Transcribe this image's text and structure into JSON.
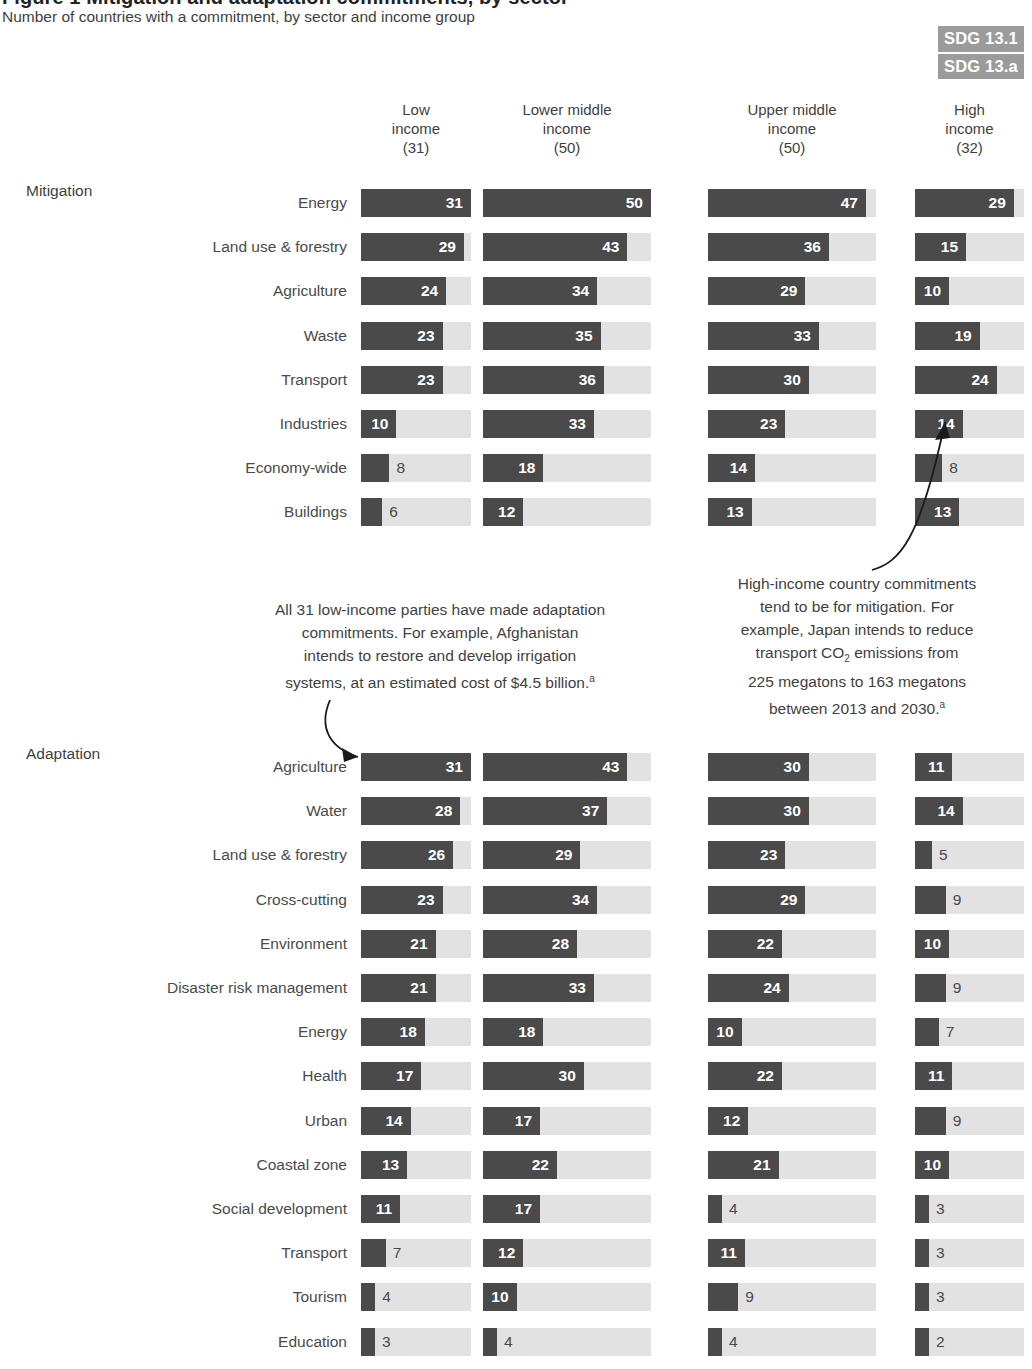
{
  "header": {
    "title": "Figure 1  Mitigation and adaptation commitments, by sector",
    "subtitle": "Number of countries with a commitment, by sector and income group",
    "badges": [
      "SDG 13.1",
      "SDG 13.a"
    ]
  },
  "sections": {
    "mitigation_label": "Mitigation",
    "adaptation_label": "Adaptation"
  },
  "annotations": {
    "left": {
      "line1": "All 31 low-income parties have made adaptation",
      "line2": "commitments. For example, Afghanistan",
      "line3": "intends to restore and develop irrigation",
      "line4": "systems, at an estimated cost of $4.5 billion.",
      "marker": "a"
    },
    "right": {
      "line1": "High-income country commitments",
      "line2": "tend to be for mitigation. For",
      "line3": "example, Japan intends to reduce",
      "line4a": "transport CO",
      "line4sub": "2",
      "line4b": " emissions from",
      "line5": "225 megatons to 163 megatons",
      "line6": "between 2013 and 2030.",
      "marker": "a"
    }
  },
  "colors": {
    "bar": "#4a4a4a",
    "track": "#e2e2e2",
    "badge": "#9b9b9b",
    "text": "#3f3f3f"
  },
  "chart_data": {
    "type": "bar",
    "title": "Mitigation and adaptation commitments, by sector",
    "subtitle": "Number of countries with a commitment, by sector and income group",
    "xlabel": "",
    "ylabel": "",
    "grid": false,
    "legend_position": "none",
    "orientation": "horizontal",
    "groups": [
      {
        "name": "Low income",
        "header_lines": [
          "Low",
          "income",
          "(31)"
        ],
        "total": 31,
        "axis_max": 31
      },
      {
        "name": "Lower middle income",
        "header_lines": [
          "Lower middle",
          "income",
          "(50)"
        ],
        "total": 50,
        "axis_max": 50
      },
      {
        "name": "Upper middle income",
        "header_lines": [
          "Upper middle",
          "income",
          "(50)"
        ],
        "total": 50,
        "axis_max": 50
      },
      {
        "name": "High income",
        "header_lines": [
          "High",
          "income",
          "(32)"
        ],
        "total": 32,
        "axis_max": 32
      }
    ],
    "panels": [
      {
        "name": "Mitigation",
        "categories": [
          "Energy",
          "Land use & forestry",
          "Agriculture",
          "Waste",
          "Transport",
          "Industries",
          "Economy-wide",
          "Buildings"
        ],
        "series": [
          {
            "name": "Low income",
            "values": [
              31,
              29,
              24,
              23,
              23,
              10,
              8,
              6
            ]
          },
          {
            "name": "Lower middle income",
            "values": [
              50,
              43,
              34,
              35,
              36,
              33,
              18,
              12
            ]
          },
          {
            "name": "Upper middle income",
            "values": [
              47,
              36,
              29,
              33,
              30,
              23,
              14,
              13
            ]
          },
          {
            "name": "High income",
            "values": [
              29,
              15,
              10,
              19,
              24,
              14,
              8,
              13
            ]
          }
        ]
      },
      {
        "name": "Adaptation",
        "categories": [
          "Agriculture",
          "Water",
          "Land use & forestry",
          "Cross-cutting",
          "Environment",
          "Disaster risk management",
          "Energy",
          "Health",
          "Urban",
          "Coastal zone",
          "Social development",
          "Transport",
          "Tourism",
          "Education"
        ],
        "series": [
          {
            "name": "Low income",
            "values": [
              31,
              28,
              26,
              23,
              21,
              21,
              18,
              17,
              14,
              13,
              11,
              7,
              4,
              3
            ]
          },
          {
            "name": "Lower middle income",
            "values": [
              43,
              37,
              29,
              34,
              28,
              33,
              18,
              30,
              17,
              22,
              17,
              12,
              10,
              4
            ]
          },
          {
            "name": "Upper middle income",
            "values": [
              30,
              30,
              23,
              29,
              22,
              24,
              10,
              22,
              12,
              21,
              4,
              11,
              9,
              4
            ]
          },
          {
            "name": "High income",
            "values": [
              11,
              14,
              5,
              9,
              10,
              9,
              7,
              11,
              9,
              10,
              3,
              3,
              3,
              2
            ]
          }
        ]
      }
    ]
  }
}
